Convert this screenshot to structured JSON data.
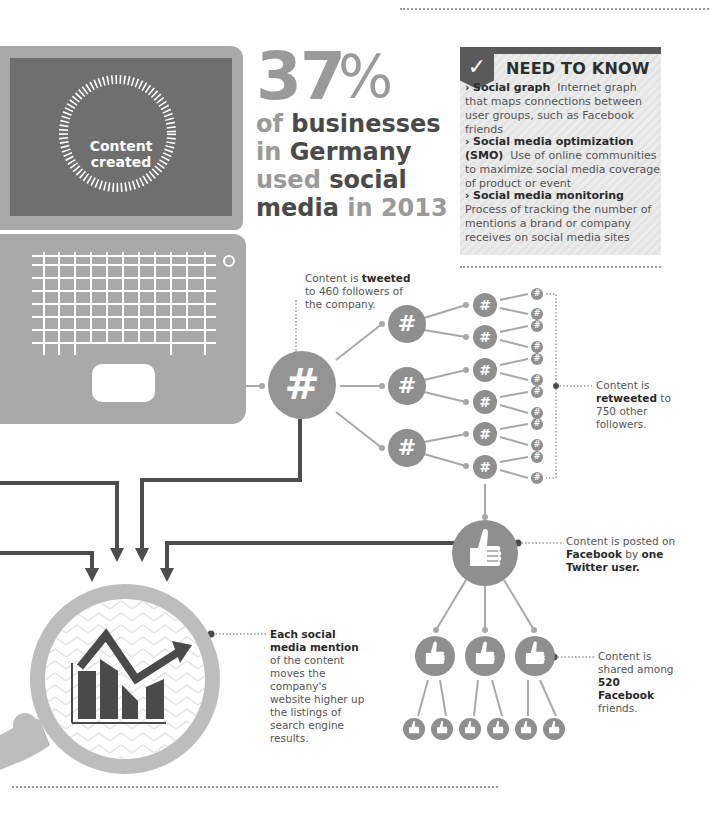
{
  "laptop": {
    "screen_label_line1": "Content",
    "screen_label_line2": "created"
  },
  "stat": {
    "number": "37",
    "percent_sign": "%",
    "line1_light": "of",
    "line1_dark": " businesses",
    "line2_light": "in",
    "line2_dark": " Germany",
    "line3_light": "used",
    "line3_dark": " social",
    "line4_dark": "media",
    "line4_light": " in 2013"
  },
  "need_to_know": {
    "title": "NEED TO KNOW",
    "check_icon": "✓",
    "items": [
      {
        "term": "Social graph",
        "definition": "Internet graph that maps connections between user groups, such as Facebook friends"
      },
      {
        "term": "Social media optimization (SMO)",
        "definition": "Use of online communities to maximize social media coverage of product or event"
      },
      {
        "term": "Social media monitoring",
        "definition": "Process of tracking the number of mentions a brand or company receives on social media sites"
      }
    ]
  },
  "captions": {
    "tweeted": {
      "pre": "Content is ",
      "bold": "tweeted",
      "post": " to 460 followers of the company."
    },
    "retweeted": {
      "pre": "Content is ",
      "bold": "retweeted",
      "post": " to 750 other followers."
    },
    "facebook": {
      "pre": "Content is posted on ",
      "bold": "Facebook",
      "mid": " by ",
      "bold2": "one Twitter user."
    },
    "shared": {
      "pre": "Content is shared among ",
      "bold": "520 Facebook",
      "post": " friends."
    },
    "seo": {
      "bold": "Each social media mention",
      "post": " of the content moves the company's website higher up the listings of search engine results."
    }
  },
  "icons": {
    "hashtag": "#",
    "thumbs_up": "thumbs-up",
    "chart_up": "rising-bar-chart",
    "magnifier": "magnifying-glass"
  },
  "colors": {
    "dark_gray": "#4a4a4a",
    "mid_gray": "#8f8f8f",
    "light_gray": "#a9a9a9",
    "screen_gray": "#6f6f6f",
    "panel_bg": "#e8e8e8"
  }
}
